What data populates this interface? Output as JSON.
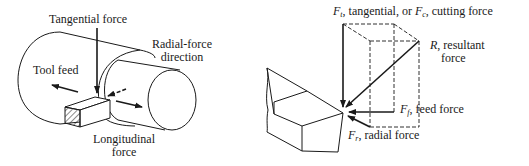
{
  "left_figure": {
    "labels": {
      "tangential_force": "Tangential force",
      "radial_force_line1": "Radial-force",
      "radial_force_line2": "direction",
      "tool_feed": "Tool feed",
      "longitudinal_line1": "Longitudinal",
      "longitudinal_line2": "force"
    }
  },
  "right_figure": {
    "labels": {
      "ft_symbol": "F",
      "ft_sub": "t",
      "ft_text": ", tangential, or ",
      "fc_symbol": "F",
      "fc_sub": "c",
      "fc_text": ", cutting force",
      "r_symbol": "R",
      "r_text_line1": ", resultant",
      "r_text_line2": "force",
      "ff_symbol": "F",
      "ff_sub": "f",
      "ff_text": ", feed force",
      "fr_symbol": "F",
      "fr_sub": "r",
      "fr_text": ", radial force"
    }
  },
  "colors": {
    "ink": "#1a1a1a",
    "background": "#ffffff"
  }
}
